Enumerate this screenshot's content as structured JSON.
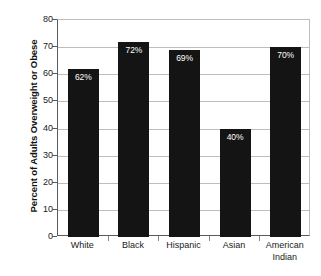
{
  "chart_data": {
    "type": "bar",
    "title": "",
    "subtitle": "",
    "xlabel": "",
    "ylabel": "Percent of Adults Overweight or Obese",
    "categories": [
      "White",
      "Black",
      "Hispanic",
      "Asian",
      "American Indian"
    ],
    "category_lines": [
      [
        "White"
      ],
      [
        "Black"
      ],
      [
        "Hispanic"
      ],
      [
        "Asian"
      ],
      [
        "American",
        "Indian"
      ]
    ],
    "values": [
      62,
      72,
      69,
      40,
      70
    ],
    "data_labels": [
      "62%",
      "72%",
      "69%",
      "40%",
      "70%"
    ],
    "ylim": [
      0,
      80
    ],
    "ytick_values": [
      0,
      10,
      20,
      30,
      40,
      50,
      60,
      70,
      80
    ],
    "ytick_labels": [
      "0",
      "10",
      "20",
      "30",
      "40",
      "50",
      "60",
      "70",
      "80"
    ],
    "grid": "horizontal",
    "legend": "none",
    "bar_color": "#141414",
    "grid_color": "#bdbdbd",
    "axis_color": "#5a5a5a",
    "label_text_color": "#ffffff",
    "background_color": "#ffffff"
  }
}
